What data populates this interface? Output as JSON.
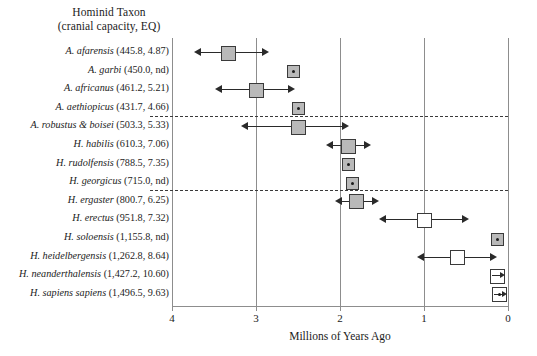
{
  "header": {
    "line1": "Hominid Taxon",
    "line2": "(cranial capacity, EQ)"
  },
  "axis": {
    "xlabel": "Millions of Years Ago",
    "ticks": [
      "4",
      "3",
      "2",
      "1",
      "0"
    ]
  },
  "chart_data": {
    "type": "scatter",
    "title": "Hominid Taxon (cranial capacity, EQ)",
    "xlabel": "Millions of Years Ago",
    "ylabel": "",
    "xlim": [
      4,
      0
    ],
    "x_axis_direction": "reversed",
    "grid": "vertical gridlines at 4, 3, 2, 1, 0",
    "legend": "none",
    "annotations": [
      "dashed horizontal separator below A. aethiopicus",
      "dashed horizontal separator below H. georgicus"
    ],
    "categories": [
      "A. afarensis (445.8, 4.87)",
      "A. garbi (450.0, nd)",
      "A. africanus (461.2, 5.21)",
      "A. aethiopicus (431.7, 4.66)",
      "A. robustus & boisei (503.3, 5.33)",
      "H. habilis (610.3, 7.06)",
      "H. rudolfensis (788.5, 7.35)",
      "H. georgicus (715.0, nd)",
      "H. ergaster (800.7, 6.25)",
      "H. erectus (951.8, 7.32)",
      "H. soloensis (1,155.8, nd)",
      "H. heidelbergensis (1,262.8, 8.64)",
      "H. neanderthalensis (1,427.2, 10.60)",
      "H. sapiens sapiens (1,496.5, 9.63)"
    ],
    "points": [
      {
        "taxon": "A. afarensis",
        "cranial_capacity": 445.8,
        "eq": 4.87,
        "midpoint_mya": 3.33,
        "range_start_mya": 3.65,
        "range_end_mya": 2.93,
        "marker": "filled-square",
        "has_range": true
      },
      {
        "taxon": "A. garbi",
        "cranial_capacity": 450.0,
        "eq": null,
        "midpoint_mya": 2.55,
        "range_start_mya": 2.55,
        "range_end_mya": 2.55,
        "marker": "dot-square",
        "has_range": false
      },
      {
        "taxon": "A. africanus",
        "cranial_capacity": 461.2,
        "eq": 5.21,
        "midpoint_mya": 3.0,
        "range_start_mya": 3.4,
        "range_end_mya": 2.62,
        "marker": "filled-square",
        "has_range": true
      },
      {
        "taxon": "A. aethiopicus",
        "cranial_capacity": 431.7,
        "eq": 4.66,
        "midpoint_mya": 2.5,
        "range_start_mya": 2.55,
        "range_end_mya": 2.45,
        "marker": "dot-square",
        "has_range": false
      },
      {
        "taxon": "A. robustus & boisei",
        "cranial_capacity": 503.3,
        "eq": 5.33,
        "midpoint_mya": 2.5,
        "range_start_mya": 3.1,
        "range_end_mya": 1.98,
        "marker": "filled-square",
        "has_range": true
      },
      {
        "taxon": "H. habilis",
        "cranial_capacity": 610.3,
        "eq": 7.06,
        "midpoint_mya": 1.9,
        "range_start_mya": 2.08,
        "range_end_mya": 1.72,
        "marker": "filled-square",
        "has_range": true
      },
      {
        "taxon": "H. rudolfensis",
        "cranial_capacity": 788.5,
        "eq": 7.35,
        "midpoint_mya": 1.9,
        "range_start_mya": 1.9,
        "range_end_mya": 1.9,
        "marker": "dot-square",
        "has_range": false
      },
      {
        "taxon": "H. georgicus",
        "cranial_capacity": 715.0,
        "eq": null,
        "midpoint_mya": 1.85,
        "range_start_mya": 1.85,
        "range_end_mya": 1.85,
        "marker": "dot-square",
        "has_range": false
      },
      {
        "taxon": "H. ergaster",
        "cranial_capacity": 800.7,
        "eq": 6.25,
        "midpoint_mya": 1.8,
        "range_start_mya": 1.98,
        "range_end_mya": 1.62,
        "marker": "filled-square",
        "has_range": true
      },
      {
        "taxon": "H. erectus",
        "cranial_capacity": 951.8,
        "eq": 7.32,
        "midpoint_mya": 1.0,
        "range_start_mya": 1.45,
        "range_end_mya": 0.55,
        "marker": "open-square",
        "has_range": true
      },
      {
        "taxon": "H. soloensis",
        "cranial_capacity": 1155.8,
        "eq": null,
        "midpoint_mya": 0.12,
        "range_start_mya": 0.12,
        "range_end_mya": 0.12,
        "marker": "dot-square",
        "has_range": false
      },
      {
        "taxon": "H. heidelbergensis",
        "cranial_capacity": 1262.8,
        "eq": 8.64,
        "midpoint_mya": 0.6,
        "range_start_mya": 1.0,
        "range_end_mya": 0.22,
        "marker": "open-square",
        "has_range": true
      },
      {
        "taxon": "H. neanderthalensis",
        "cranial_capacity": 1427.2,
        "eq": 10.6,
        "midpoint_mya": 0.12,
        "range_start_mya": 0.12,
        "range_end_mya": 0.12,
        "marker": "open-square-arrow",
        "has_range": false
      },
      {
        "taxon": "H. sapiens sapiens",
        "cranial_capacity": 1496.5,
        "eq": 9.63,
        "midpoint_mya": 0.1,
        "range_start_mya": 0.1,
        "range_end_mya": 0.1,
        "marker": "open-square-arrow",
        "has_range": false
      }
    ]
  },
  "rows": [
    {
      "label_italic": "A. afarensis ",
      "label_roman": "(445.8, 4.87)"
    },
    {
      "label_italic": "A. garbi ",
      "label_roman": "(450.0, nd)"
    },
    {
      "label_italic": "A. africanus ",
      "label_roman": "(461.2, 5.21)"
    },
    {
      "label_italic": "A. aethiopicus ",
      "label_roman": "(431.7, 4.66)"
    },
    {
      "label_italic": "A. robustus & boisei ",
      "label_roman": "(503.3, 5.33)"
    },
    {
      "label_italic": "H. habilis ",
      "label_roman": "(610.3, 7.06)"
    },
    {
      "label_italic": "H. rudolfensis ",
      "label_roman": "(788.5, 7.35)"
    },
    {
      "label_italic": "H. georgicus ",
      "label_roman": "(715.0, nd)"
    },
    {
      "label_italic": "H. ergaster ",
      "label_roman": "(800.7, 6.25)"
    },
    {
      "label_italic": "H. erectus ",
      "label_roman": "(951.8, 7.32)"
    },
    {
      "label_italic": "H. soloensis ",
      "label_roman": "(1,155.8, nd)"
    },
    {
      "label_italic": "H. heidelbergensis ",
      "label_roman": "(1,262.8, 8.64)"
    },
    {
      "label_italic": "H. neanderthalensis ",
      "label_roman": "(1,427.2, 10.60)"
    },
    {
      "label_italic": "H. sapiens sapiens ",
      "label_roman": "(1,496.5, 9.63)"
    }
  ],
  "colors": {
    "filled_marker": "#b9b9b9",
    "open_marker": "#ffffff",
    "marker_border": "#3a3a3a",
    "gridline": "#8d8d8d",
    "text": "#1b1b1b"
  }
}
